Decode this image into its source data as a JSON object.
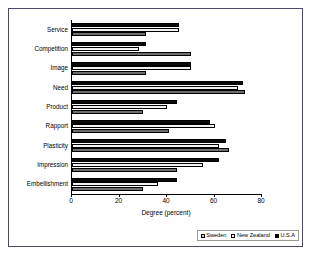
{
  "chart_data": {
    "type": "bar",
    "orientation": "horizontal",
    "title": "",
    "xlabel": "Degree (percent)",
    "ylabel": "",
    "xlim": [
      0,
      80
    ],
    "xticks": [
      0,
      20,
      40,
      60,
      80
    ],
    "grid": false,
    "legend_position": "bottom-right",
    "categories": [
      "Service",
      "Competition",
      "Image",
      "Need",
      "Product",
      "Rapport",
      "Plasticity",
      "Impression",
      "Embellishment"
    ],
    "series": [
      {
        "name": "Sweden",
        "fill": "gray-hatch",
        "values": [
          31,
          50,
          31,
          73,
          30,
          41,
          66,
          44,
          30
        ]
      },
      {
        "name": "New Zealand",
        "fill": "white",
        "values": [
          45,
          28,
          50,
          70,
          40,
          60,
          62,
          55,
          36
        ]
      },
      {
        "name": "U.S.A",
        "fill": "black",
        "values": [
          45,
          31,
          50,
          72,
          44,
          58,
          65,
          62,
          44
        ]
      }
    ]
  },
  "colors": {
    "frame_border": "#4a4a6a",
    "axis": "#000000",
    "sweden": "#9a9a9a",
    "new_zealand": "#f2f2f2",
    "usa": "#0a0a0a",
    "background": "#ffffff"
  }
}
